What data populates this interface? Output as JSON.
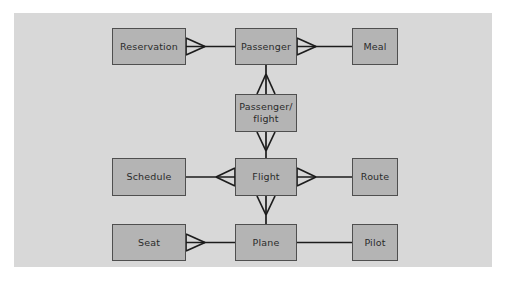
{
  "diagram": {
    "type": "entity-relationship-diagram",
    "notation": "crow's foot",
    "canvas_color": "#d8d8d8",
    "entity_fill_color": "#b4b4b4",
    "entity_border_color": "#4f4f4f",
    "connector_color": "#1c1c1c",
    "page_background": "#ffffff",
    "entities": [
      {
        "id": "reservation",
        "label": "Reservation",
        "x": 112,
        "y": 28,
        "w": 74,
        "h": 37
      },
      {
        "id": "passenger",
        "label": "Passenger",
        "x": 235,
        "y": 28,
        "w": 62,
        "h": 37
      },
      {
        "id": "meal",
        "label": "Meal",
        "x": 352,
        "y": 28,
        "w": 46,
        "h": 37
      },
      {
        "id": "passenger-flight",
        "label": "Passenger/\nflight",
        "x": 235,
        "y": 94,
        "w": 62,
        "h": 38
      },
      {
        "id": "schedule",
        "label": "Schedule",
        "x": 112,
        "y": 158,
        "w": 74,
        "h": 38
      },
      {
        "id": "flight",
        "label": "Flight",
        "x": 235,
        "y": 158,
        "w": 62,
        "h": 38
      },
      {
        "id": "route",
        "label": "Route",
        "x": 352,
        "y": 158,
        "w": 46,
        "h": 38
      },
      {
        "id": "seat",
        "label": "Seat",
        "x": 112,
        "y": 224,
        "w": 74,
        "h": 37
      },
      {
        "id": "plane",
        "label": "Plane",
        "x": 235,
        "y": 224,
        "w": 62,
        "h": 37
      },
      {
        "id": "pilot",
        "label": "Pilot",
        "x": 352,
        "y": 224,
        "w": 46,
        "h": 37
      }
    ],
    "relationships": [
      {
        "id": "reservation-passenger",
        "from": "reservation",
        "to": "passenger",
        "many_end": "reservation"
      },
      {
        "id": "passenger-meal",
        "from": "passenger",
        "to": "meal",
        "many_end": "passenger"
      },
      {
        "id": "passenger-passengerflight",
        "from": "passenger",
        "to": "passenger-flight",
        "many_end": "passenger-flight"
      },
      {
        "id": "passengerflight-flight",
        "from": "passenger-flight",
        "to": "flight",
        "many_end": "passenger-flight"
      },
      {
        "id": "schedule-flight",
        "from": "schedule",
        "to": "flight",
        "many_end": "flight"
      },
      {
        "id": "flight-route",
        "from": "flight",
        "to": "route",
        "many_end": "flight"
      },
      {
        "id": "flight-plane",
        "from": "flight",
        "to": "plane",
        "many_end": "flight"
      },
      {
        "id": "seat-plane",
        "from": "seat",
        "to": "plane",
        "many_end": "seat"
      },
      {
        "id": "plane-pilot",
        "from": "plane",
        "to": "pilot",
        "many_end": "none"
      }
    ]
  }
}
